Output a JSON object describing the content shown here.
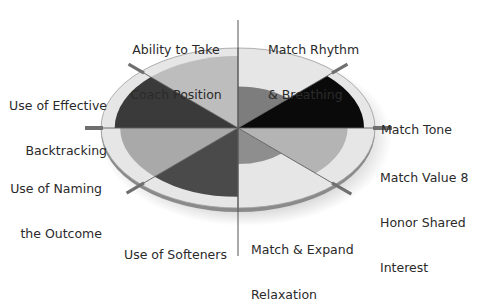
{
  "diagram": {
    "type": "radial-wheel",
    "center": [
      238,
      128
    ],
    "outer_ellipse": {
      "rx": 137,
      "ry": 80
    },
    "colors": {
      "rim": "#e3e3e3",
      "rim_edge": "#8c8c8c",
      "shadow": "#7a7a7a",
      "axis": "#6f6f6f",
      "divider": "#5e5e5e"
    },
    "sectors": [
      {
        "id": "coach-position",
        "label_lines": [
          "Ability to Take",
          "Coach Position"
        ],
        "start": 90,
        "end": 135,
        "radius": 0.9,
        "color": "#bdbdbd"
      },
      {
        "id": "backtracking",
        "label_lines": [
          "Use of Effective",
          "Backtracking"
        ],
        "start": 135,
        "end": 180,
        "radius": 0.9,
        "color": "#3a3a3a"
      },
      {
        "id": "naming-outcome",
        "label_lines": [
          "Use of Naming",
          "the Outcome"
        ],
        "start": 180,
        "end": 225,
        "radius": 0.86,
        "color": "#a9a9a9"
      },
      {
        "id": "softeners",
        "label_lines": [
          "Use of Softeners"
        ],
        "start": 225,
        "end": 270,
        "radius": 0.86,
        "color": "#4a4a4a"
      },
      {
        "id": "relaxation",
        "label_lines": [
          "Match & Expand",
          "Relaxation"
        ],
        "start": 270,
        "end": 315,
        "radius": 0.45,
        "color": "#8e8e8e"
      },
      {
        "id": "value-interest",
        "label_lines": [
          "Match Value 8",
          "Honor Shared",
          "Interest"
        ],
        "start": 315,
        "end": 360,
        "radius": 0.8,
        "color": "#b4b4b4"
      },
      {
        "id": "match-tone",
        "label_lines": [
          "Match Tone"
        ],
        "start": 0,
        "end": 45,
        "radius": 0.92,
        "color": "#0a0a0a"
      },
      {
        "id": "rhythm-breathing",
        "label_lines": [
          "Match Rhythm",
          "& Breathing"
        ],
        "start": 45,
        "end": 90,
        "radius": 0.52,
        "color": "#7d7d7d"
      }
    ]
  }
}
